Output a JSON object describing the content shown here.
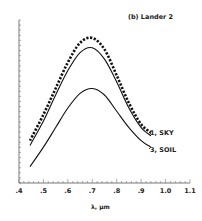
{
  "chart_data": {
    "type": "line",
    "title": "(b) Lander 2",
    "xlabel": "λ, μm",
    "ylabel": "",
    "xlim": [
      0.4,
      1.1
    ],
    "ylim": [
      0,
      1
    ],
    "x_ticks": [
      ".4",
      ".5",
      ".6",
      ".7",
      ".8",
      ".9",
      "1.0",
      "1.1"
    ],
    "y_ticks_labeled": false,
    "grid": false,
    "legend_position": "inline-right",
    "x": [
      0.445,
      0.5,
      0.55,
      0.6,
      0.65,
      0.7,
      0.75,
      0.8,
      0.85,
      0.9,
      0.94
    ],
    "series": [
      {
        "name": "dotted (upper)",
        "style": "dotted-thick",
        "values": [
          0.26,
          0.42,
          0.58,
          0.74,
          0.86,
          0.89,
          0.82,
          0.66,
          0.49,
          0.36,
          0.31
        ]
      },
      {
        "name": "1, SKY",
        "style": "solid",
        "values": [
          0.23,
          0.38,
          0.54,
          0.69,
          0.8,
          0.83,
          0.76,
          0.62,
          0.46,
          0.34,
          0.29
        ]
      },
      {
        "name": "3, SOIL",
        "style": "solid",
        "values": [
          0.1,
          0.22,
          0.34,
          0.46,
          0.55,
          0.58,
          0.54,
          0.44,
          0.34,
          0.26,
          0.22
        ]
      }
    ],
    "annotations": [
      "1, SKY",
      "3, SOIL"
    ]
  },
  "labels": {
    "panel_title": "(b)  Lander  2",
    "x_axis": "λ,  μm",
    "sky": "1, SKY",
    "soil": "3, SOIL",
    "ticks": [
      ".4",
      ".5",
      ".6",
      ".7",
      ".8",
      ".9",
      "1.0",
      "1.1"
    ]
  }
}
